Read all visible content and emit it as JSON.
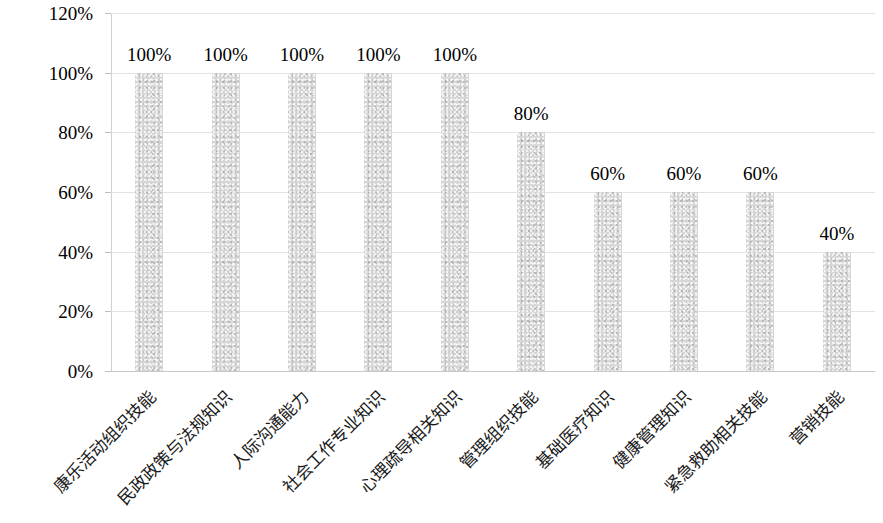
{
  "chart_data": {
    "type": "bar",
    "title": "",
    "subtitle": "",
    "xlabel": "",
    "ylabel": "",
    "grid": true,
    "legend": false,
    "orientation": "vertical",
    "ylim": [
      0,
      120
    ],
    "y_tick_labels": [
      "0%",
      "20%",
      "40%",
      "60%",
      "80%",
      "100%",
      "120%"
    ],
    "y_tick_values": [
      0,
      20,
      40,
      60,
      80,
      100,
      120
    ],
    "categories": [
      "康乐活动组织技能",
      "民政政策与法规知识",
      "人际沟通能力",
      "社会工作专业知识",
      "心理疏导相关知识",
      "管理组织技能",
      "基础医疗知识",
      "健康管理知识",
      "紧急救助相关技能",
      "营销技能"
    ],
    "values": [
      100,
      100,
      100,
      100,
      100,
      80,
      60,
      60,
      60,
      40
    ],
    "data_labels": [
      "100%",
      "100%",
      "100%",
      "100%",
      "100%",
      "80%",
      "60%",
      "60%",
      "60%",
      "40%"
    ],
    "series": [
      {
        "name": "",
        "values": [
          100,
          100,
          100,
          100,
          100,
          80,
          60,
          60,
          60,
          40
        ]
      }
    ],
    "colors": {
      "bar_fill": "#d6d6d6",
      "gridline": "#e2e2e2",
      "axis_line": "#c9c9c9",
      "text": "#000000",
      "background": "#ffffff"
    }
  }
}
